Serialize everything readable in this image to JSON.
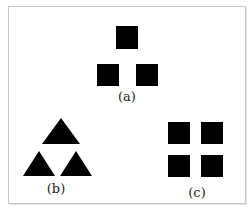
{
  "figure": {
    "panels": [
      {
        "id": "a",
        "label": "(a)",
        "shape": "square",
        "count": 3,
        "arrangement": "triangle"
      },
      {
        "id": "b",
        "label": "(b)",
        "shape": "triangle",
        "count": 3,
        "arrangement": "triangle"
      },
      {
        "id": "c",
        "label": "(c)",
        "shape": "square",
        "count": 4,
        "arrangement": "2x2 grid"
      }
    ],
    "fill_color": "#000000",
    "frame_color": "#c8c8c8"
  }
}
